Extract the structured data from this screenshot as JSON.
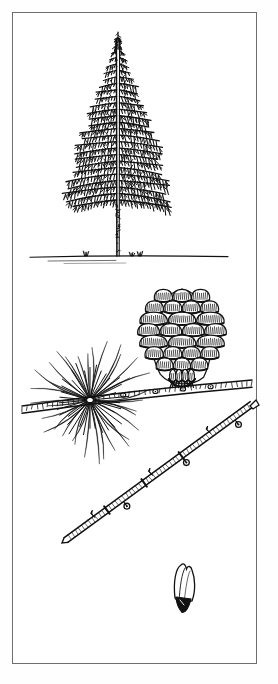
{
  "plate": {
    "kind": "botanical-line-illustration",
    "subject": "conifer (larch) plate",
    "background_color": "#ffffff",
    "ink_color": "#111111",
    "border_color": "#6f6f6f",
    "border": {
      "x": 12,
      "y": 12,
      "width": 245,
      "height": 652,
      "stroke_width": 1
    },
    "figures": [
      {
        "id": "tree-habit",
        "name": "whole-tree-habit",
        "label": "conifer tree in full habit with conical crown, whorled horizontal branches, straight bare trunk",
        "bbox": {
          "x": 52,
          "y": 36,
          "width": 132,
          "height": 232
        },
        "crown": {
          "apex_x": 118,
          "apex_y": 38,
          "base_y": 200,
          "half_width_max": 66,
          "whorl_count": 26
        },
        "trunk": {
          "x": 118,
          "top_y": 40,
          "bottom_y": 256,
          "width": 3
        },
        "ground_line": {
          "y": 256,
          "x_start": 30,
          "x_end": 228,
          "tufts": [
            {
              "x": 86
            },
            {
              "x": 132
            },
            {
              "x": 140
            }
          ]
        }
      },
      {
        "id": "needle-rosette",
        "name": "needle-rosette-fascicle",
        "label": "radial cluster of linear needles on a short spur shoot",
        "bbox": {
          "x": 24,
          "y": 330,
          "width": 132,
          "height": 140
        },
        "center": {
          "x": 90,
          "y": 400
        },
        "needle_count": 34,
        "needle_length_min": 42,
        "needle_length_max": 66
      },
      {
        "id": "cone",
        "name": "seed-cone",
        "label": "ovoid woody seed cone with overlapping hatched scales, attached to branch",
        "bbox": {
          "x": 146,
          "y": 288,
          "width": 72,
          "height": 96
        },
        "scale_rows": 8,
        "orientation": "upright-on-branch"
      },
      {
        "id": "bearing-branch",
        "name": "cone-bearing-branch",
        "label": "horizontal woody branch carrying the cone and passing behind the needle rosette",
        "path": {
          "x_start": 22,
          "y_start": 410,
          "x_end": 252,
          "y_end": 384
        }
      },
      {
        "id": "winter-twig",
        "name": "bare-winter-twig",
        "label": "leafless twig with short spur shoots and lateral buds, diagonal",
        "path": {
          "x_start": 66,
          "y_start": 540,
          "x_end": 252,
          "y_end": 404
        },
        "bud_count": 6
      },
      {
        "id": "winged-seed",
        "name": "winged-seed",
        "label": "single winged seed (samara) with dark seed body and pale membranous wing",
        "bbox": {
          "x": 172,
          "y": 563,
          "width": 26,
          "height": 50
        }
      }
    ]
  }
}
